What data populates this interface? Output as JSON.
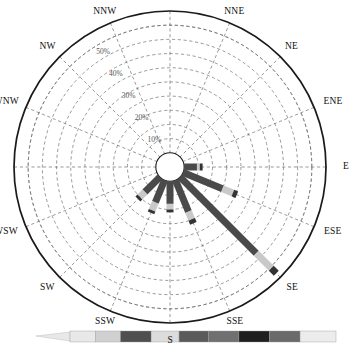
{
  "chart_data": {
    "type": "bar",
    "subtype": "wind-rose-polar",
    "title": "",
    "xlabel": "",
    "ylabel": "",
    "grid": true,
    "legend_position": "bottom",
    "center_hole_pct": 5,
    "rlim": [
      0,
      55
    ],
    "radial_ticks": [
      10,
      20,
      30,
      40,
      50
    ],
    "radial_tick_labels": [
      "10%",
      "20%",
      "30%",
      "40%",
      "50%"
    ],
    "categories": [
      "N",
      "NNE",
      "NE",
      "ENE",
      "E",
      "ESE",
      "SE",
      "SSE",
      "S",
      "SSW",
      "SW",
      "WSW",
      "W",
      "WNW",
      "NW",
      "NNW"
    ],
    "angles_deg": [
      0,
      22.5,
      45,
      67.5,
      90,
      112.5,
      135,
      157.5,
      180,
      202.5,
      225,
      247.5,
      270,
      292.5,
      315,
      337.5
    ],
    "values": [
      0,
      0,
      0,
      0,
      6.5,
      20.5,
      48,
      16.5,
      11,
      12.5,
      11,
      0,
      0,
      0,
      0,
      0
    ],
    "series": [
      {
        "name": "band-1",
        "color": "#4a4a4a",
        "values": [
          0,
          0,
          0,
          0,
          4.5,
          15.0,
          38.0,
          12.0,
          8.0,
          8.5,
          7.5,
          0,
          0,
          0,
          0,
          0
        ]
      },
      {
        "name": "band-2",
        "color": "#c9c9c9",
        "values": [
          0,
          0,
          0,
          0,
          1.0,
          4.0,
          7.5,
          3.0,
          2.0,
          3.0,
          2.5,
          0,
          0,
          0,
          0,
          0
        ]
      },
      {
        "name": "band-3",
        "color": "#333333",
        "values": [
          0,
          0,
          0,
          0,
          1.0,
          1.5,
          2.5,
          1.5,
          1.0,
          1.0,
          1.0,
          0,
          0,
          0,
          0,
          0
        ]
      }
    ],
    "spoke_width_px": 7,
    "colors": {
      "outline": "#1a1a1a",
      "grid": "#6e6e6e",
      "band_dark": "#4a4a4a",
      "band_light": "#c9c9c9",
      "band_cap": "#333333",
      "background": "#ffffff"
    },
    "legend_bar": {
      "orientation": "horizontal",
      "tapered_left": true,
      "segments": [
        {
          "color": "#e8e8e8",
          "width_pct": 9.5
        },
        {
          "color": "#d0d0d0",
          "width_pct": 9.5
        },
        {
          "color": "#4f4f4f",
          "width_pct": 11.5
        },
        {
          "color": "#dcdcdc",
          "width_pct": 10.5
        },
        {
          "color": "#5a5a5a",
          "width_pct": 11.0
        },
        {
          "color": "#707070",
          "width_pct": 11.5
        },
        {
          "color": "#1e1e1e",
          "width_pct": 11.5
        },
        {
          "color": "#6a6a6a",
          "width_pct": 11.5
        },
        {
          "color": "#ececec",
          "width_pct": 13.5
        }
      ]
    }
  },
  "compass": {
    "labels": {
      "n": "N",
      "nne": "NNE",
      "ne": "NE",
      "ene": "ENE",
      "e": "E",
      "ese": "ESE",
      "se": "SE",
      "sse": "SSE",
      "s": "S",
      "ssw": "SSW",
      "sw": "SW",
      "wsw": "WSW",
      "w": "W",
      "wnw": "WNW",
      "nw": "NW",
      "nnw": "NNW"
    }
  },
  "radial_axis": {
    "t10": "10%",
    "t20": "20%",
    "t30": "30%",
    "t40": "40%",
    "t50": "50%"
  }
}
